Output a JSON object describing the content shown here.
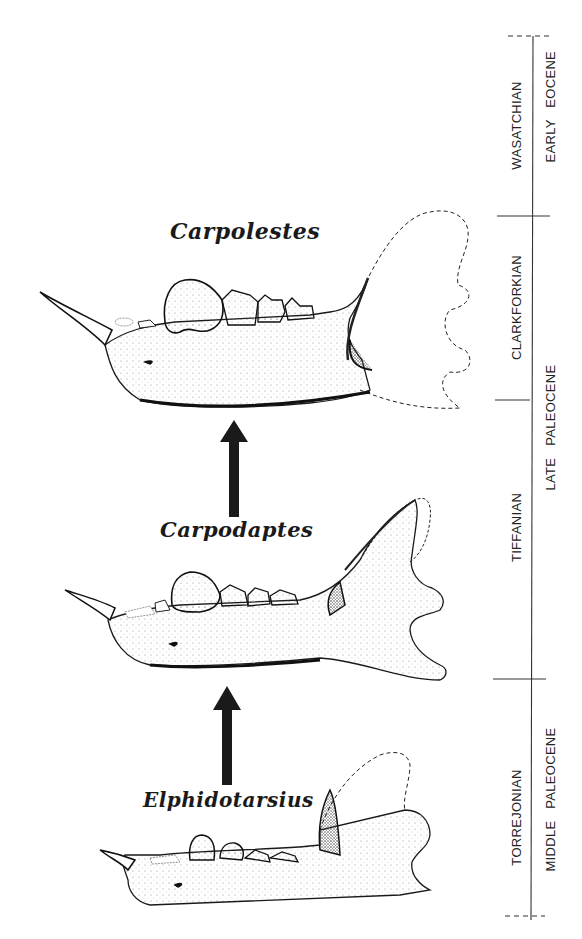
{
  "figure": {
    "taxa": [
      {
        "name": "Carpolestes",
        "position": "top"
      },
      {
        "name": "Carpodaptes",
        "position": "middle"
      },
      {
        "name": "Elphidotarsius",
        "position": "bottom"
      }
    ],
    "arrows": [
      {
        "from": "Carpodaptes",
        "to": "Carpolestes",
        "direction": "up"
      },
      {
        "from": "Elphidotarsius",
        "to": "Carpodaptes",
        "direction": "up"
      }
    ],
    "time_scale": {
      "land_mammal_ages": [
        {
          "label": "WASATCHIAN"
        },
        {
          "label": "CLARKFORKIAN"
        },
        {
          "label": "TIFFANIAN"
        },
        {
          "label": "TORREJONIAN"
        }
      ],
      "epochs": [
        {
          "label": "EARLY EOCENE"
        },
        {
          "label": "LATE PALEOCENE"
        },
        {
          "label": "MIDDLE PALEOCENE"
        }
      ]
    },
    "colors": {
      "ink": "#1a1a1a",
      "background": "#ffffff",
      "stipple": "#555555"
    }
  }
}
